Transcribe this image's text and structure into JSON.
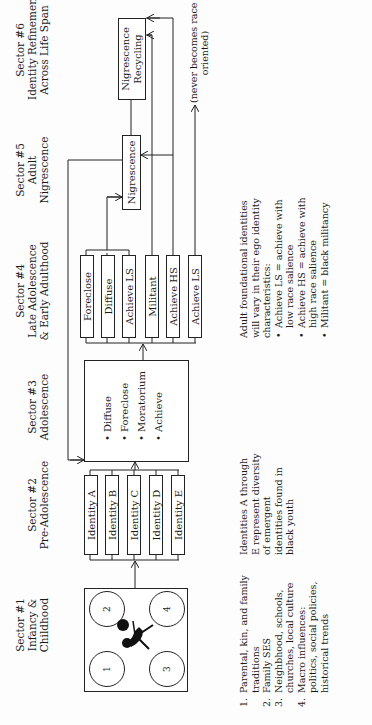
{
  "sectors": [
    {
      "title": "Sector #1",
      "subtitle_lines": [
        "Infancy &",
        "Childhood"
      ]
    },
    {
      "title": "Sector #2",
      "subtitle_lines": [
        "Pre-Adolescence"
      ]
    },
    {
      "title": "Sector #3",
      "subtitle_lines": [
        "Adolescence"
      ]
    },
    {
      "title": "Sector #4",
      "subtitle_lines": [
        "Late Adolescence",
        "& Early Adulthood"
      ]
    },
    {
      "title": "Sector #5",
      "subtitle_lines": [
        "Adult",
        "Nigrescence"
      ]
    },
    {
      "title": "Sector #6",
      "subtitle_lines": [
        "Identity Refinement",
        "Across Life Span"
      ]
    }
  ],
  "sector1_box": {
    "circles": [
      "1",
      "2",
      "3",
      "4"
    ],
    "figure": "child-with-ball-icon"
  },
  "sector2_identities": [
    "Identity A",
    "Identity B",
    "Identity C",
    "Identity D",
    "Identity E"
  ],
  "sector3_box": {
    "items": [
      "Diffuse",
      "Foreclose",
      "Moratorium",
      "Achieve"
    ]
  },
  "sector4_identities": [
    "Foreclose",
    "Diffuse",
    "Achieve LS",
    "Militant",
    "Achieve HS",
    "Achieve LS"
  ],
  "sector5_box": {
    "label": "Nigrescence"
  },
  "sector6_box": {
    "label_lines": [
      "Nigrescence",
      "Recycling"
    ]
  },
  "never_race_oriented_label": {
    "lines": [
      "(never becomes race",
      "oriented)"
    ]
  },
  "notes": {
    "sector1_list": [
      {
        "num": "1.",
        "text": "Parental, kin, and family traditions"
      },
      {
        "num": "2.",
        "text": "Family SES"
      },
      {
        "num": "3.",
        "text": "Neighbhood, schools, churches, local culture"
      },
      {
        "num": "4.",
        "text": "Macro influences: politics, social policies, historical trends"
      }
    ],
    "sector2_note": "Identities A through E represent diversity of emergent identities found in black youth",
    "sector4_note": {
      "intro": "Adult foundational identities will vary in their ego identity characteristics:",
      "bullets": [
        "Achieve LS = achieve with low race salience",
        "Achieve HS = achieve with high race salience",
        "Militant = black militancy"
      ]
    }
  }
}
